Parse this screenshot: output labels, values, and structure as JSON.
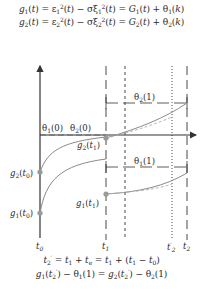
{
  "equations": {
    "top": [
      "g1(t) = ε1²(t) − σξ1²(t) = G1(t) + θ1(k)",
      "g2(t) = ε2²(t) − σξ2²(t) = G2(t) + θ2(k)"
    ],
    "bottom": [
      "t2' = t1 + te = t1 + (t1 − t0)",
      "g1(t2') − θ1(1) = g2(t2') − θ2(1)"
    ]
  },
  "labels": {
    "theta1_0": "θ1(0)",
    "theta2_0": "θ2(0)",
    "theta2_1": "θ2(1)",
    "theta1_1": "θ1(1)",
    "g2_t1": "g2(t1)",
    "g1_t1": "g1(t1)",
    "g2_t0": "g2(t0)",
    "g1_t0": "g1(t0)"
  },
  "time_ticks": [
    "t0",
    "t1",
    "t2'",
    "t2"
  ],
  "colors": {
    "axis": "#333333",
    "curve": "#8a8a8a",
    "marker": "#9a9a9a",
    "dashed_curve": "#b0b0b0"
  }
}
